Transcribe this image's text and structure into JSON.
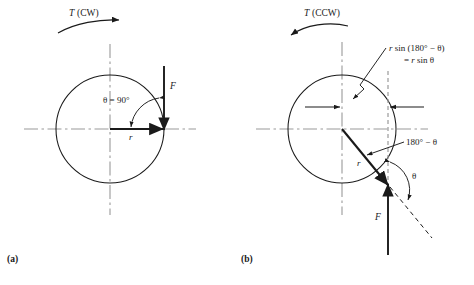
{
  "figure": {
    "type": "engineering-diagram",
    "background_color": "#ffffff",
    "line_color": "#1a1a1a",
    "centerline_color": "#9a9a9a",
    "panels": [
      {
        "id": "a",
        "caption": "(a)",
        "torque_label": "T (CW)",
        "torque_direction": "clockwise",
        "angle_label": "θ = 90°",
        "radius_label": "r",
        "force_label": "F",
        "circle": {
          "cx": 110,
          "cy": 129,
          "r": 54
        }
      },
      {
        "id": "b",
        "caption": "(b)",
        "torque_label": "T (CCW)",
        "torque_direction": "counterclockwise",
        "moment_arm_label_line1": "r sin (180° − θ)",
        "moment_arm_label_line2": "= r sin θ",
        "supplement_label": "180° − θ",
        "angle_label": "θ",
        "radius_label": "r",
        "force_label": "F",
        "circle": {
          "cx": 342,
          "cy": 129,
          "r": 54
        }
      }
    ]
  }
}
